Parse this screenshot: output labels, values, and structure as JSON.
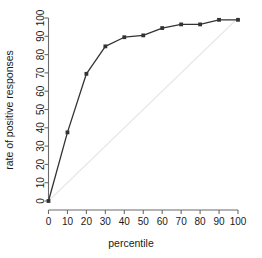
{
  "chart_data": {
    "type": "line",
    "title": "",
    "subtitle": "",
    "xlabel": "percentile",
    "ylabel": "rate of positive responses",
    "x": [
      0,
      10,
      20,
      30,
      40,
      50,
      60,
      70,
      80,
      90,
      100
    ],
    "values": [
      0,
      37.5,
      69.5,
      84.5,
      89.5,
      90.5,
      94.5,
      96.5,
      96.5,
      99,
      99
    ],
    "series": [
      {
        "name": "rate of positive responses",
        "x": [
          0,
          10,
          20,
          30,
          40,
          50,
          60,
          70,
          80,
          90,
          100
        ],
        "values": [
          0,
          37.5,
          69.5,
          84.5,
          89.5,
          90.5,
          94.5,
          96.5,
          96.5,
          99,
          99
        ],
        "color": "#333333",
        "marker": "filled-square"
      },
      {
        "name": "diagonal reference",
        "x": [
          0,
          100
        ],
        "values": [
          0,
          100
        ],
        "color": "#e8e8e8",
        "marker": "none"
      }
    ],
    "xlim": [
      0,
      100
    ],
    "ylim": [
      0,
      100
    ],
    "xticks": [
      0,
      10,
      20,
      30,
      40,
      50,
      60,
      70,
      80,
      90,
      100
    ],
    "yticks": [
      0,
      10,
      20,
      30,
      40,
      50,
      60,
      70,
      80,
      90,
      100
    ],
    "xtick_labels": [
      "0",
      "10",
      "20",
      "30",
      "40",
      "50",
      "60",
      "70",
      "80",
      "90",
      "100"
    ],
    "ytick_labels": [
      "0",
      "10",
      "20",
      "30",
      "40",
      "50",
      "60",
      "70",
      "80",
      "90",
      "100"
    ],
    "grid": false,
    "legend": false,
    "legend_position": "none",
    "axis_color": "#6b6b6b",
    "background": "#ffffff"
  }
}
